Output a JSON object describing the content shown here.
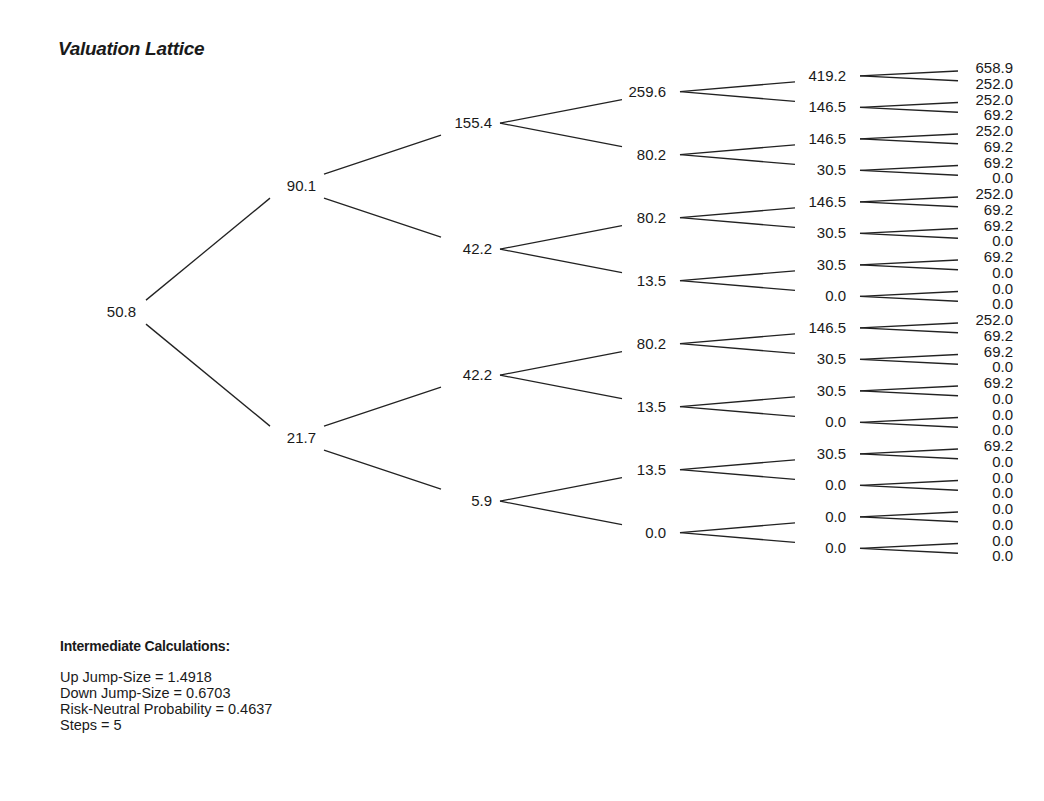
{
  "title": "Valuation Lattice",
  "chart_data": {
    "type": "binomial-tree",
    "title": "Valuation Lattice",
    "steps": 5,
    "levels": [
      [
        "50.8"
      ],
      [
        "90.1",
        "21.7"
      ],
      [
        "155.4",
        "42.2",
        "42.2",
        "5.9"
      ],
      [
        "259.6",
        "80.2",
        "80.2",
        "13.5",
        "80.2",
        "13.5",
        "13.5",
        "0.0"
      ],
      [
        "419.2",
        "146.5",
        "146.5",
        "30.5",
        "146.5",
        "30.5",
        "30.5",
        "0.0",
        "146.5",
        "30.5",
        "30.5",
        "0.0",
        "30.5",
        "0.0",
        "0.0",
        "0.0"
      ],
      [
        "658.9",
        "252.0",
        "252.0",
        "69.2",
        "252.0",
        "69.2",
        "69.2",
        "0.0",
        "252.0",
        "69.2",
        "69.2",
        "0.0",
        "69.2",
        "0.0",
        "0.0",
        "0.0",
        "252.0",
        "69.2",
        "69.2",
        "0.0",
        "69.2",
        "0.0",
        "0.0",
        "0.0",
        "69.2",
        "0.0",
        "0.0",
        "0.0",
        "0.0",
        "0.0",
        "0.0",
        "0.0"
      ]
    ]
  },
  "calculations": {
    "header": "Intermediate Calculations:",
    "lines": [
      "Up Jump-Size = 1.4918",
      "Down Jump-Size = 0.6703",
      "Risk-Neutral Probability = 0.4637",
      "Steps = 5"
    ]
  },
  "colors": {
    "line": "#222222",
    "text": "#1a1a1a"
  }
}
